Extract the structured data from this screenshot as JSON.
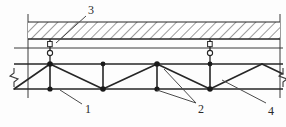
{
  "drawing": {
    "title": "Suspended steel truss under concrete slab - section detail",
    "type": "structural-section-detail",
    "width": 286,
    "height": 127,
    "line_color": "#262626",
    "hatch_color": "#4a4a4a",
    "background": "#fdfdfd"
  },
  "callouts": [
    {
      "id": "callout-3",
      "text": "3",
      "x": 88,
      "y": 4,
      "target": "suspension-hanger-rod",
      "leader": {
        "x1": 86,
        "y1": 16,
        "x2": 56,
        "y2": 43
      }
    },
    {
      "id": "callout-1",
      "text": "1",
      "x": 85,
      "y": 104,
      "target": "bottom-chord",
      "leader": {
        "x1": 82,
        "y1": 104,
        "x2": 60,
        "y2": 90
      }
    },
    {
      "id": "callout-2",
      "text": "2",
      "x": 198,
      "y": 104,
      "target": "web-diagonal-members",
      "leader": {
        "x1": 196,
        "y1": 104,
        "x2": 157,
        "y2": 88
      },
      "leader2": {
        "x1": 196,
        "y1": 104,
        "x2": 164,
        "y2": 70
      }
    },
    {
      "id": "callout-4",
      "text": "4",
      "x": 268,
      "y": 106,
      "target": "top-chord",
      "leader": {
        "x1": 266,
        "y1": 104,
        "x2": 222,
        "y2": 80
      }
    }
  ],
  "slab": {
    "name": "concrete-slab",
    "top_y": 22,
    "bottom_y": 39,
    "x1": 28,
    "x2": 280,
    "hatch": "diagonal-45"
  },
  "ceiling_line": {
    "name": "ceiling-plane-line",
    "y": 48,
    "x1": 14,
    "x2": 283
  },
  "truss": {
    "name": "steel-truss",
    "top_chord_y": 64,
    "bottom_chord_y": 89,
    "x_start": 14,
    "x_end": 283,
    "top_nodes_x": [
      50,
      103,
      157,
      210
    ],
    "bottom_nodes_x": [
      50,
      103,
      157,
      210
    ],
    "verticals": [
      {
        "x": 50
      },
      {
        "x": 103
      },
      {
        "x": 157
      },
      {
        "x": 210
      }
    ],
    "diagonals": [
      {
        "x1": 14,
        "y1": 89,
        "x2": 50,
        "y2": 64
      },
      {
        "x1": 50,
        "y1": 64,
        "x2": 103,
        "y2": 89
      },
      {
        "x1": 103,
        "y1": 89,
        "x2": 157,
        "y2": 64
      },
      {
        "x1": 157,
        "y1": 64,
        "x2": 210,
        "y2": 89
      },
      {
        "x1": 210,
        "y1": 89,
        "x2": 262,
        "y2": 64
      },
      {
        "x1": 50,
        "y1": 89,
        "x2": 50,
        "y2": 64
      }
    ]
  },
  "hangers": [
    {
      "name": "suspension-hanger-left",
      "x": 50,
      "top_y": 39,
      "bottom_y": 64,
      "ring_y": 52
    },
    {
      "name": "suspension-hanger-right",
      "x": 210,
      "top_y": 39,
      "bottom_y": 64,
      "ring_y": 52
    }
  ],
  "break_marks": [
    {
      "name": "break-line-left",
      "x": 14,
      "y": 76
    },
    {
      "name": "break-line-right",
      "x": 283,
      "y": 76
    }
  ],
  "frame_edges": {
    "left_x": 28,
    "right_x": 280,
    "top_y": 14,
    "bottom_y": 98
  }
}
